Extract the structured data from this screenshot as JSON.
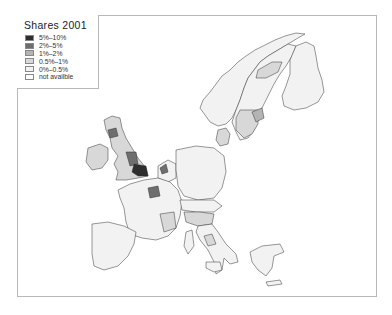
{
  "legend": {
    "title": "Shares 2001",
    "items": [
      {
        "label": "5%–10%",
        "color": "#2e2e2e"
      },
      {
        "label": "2%–5%",
        "color": "#6e6e6e"
      },
      {
        "label": "1%–2%",
        "color": "#b4b4b4"
      },
      {
        "label": "0.5%–1%",
        "color": "#d8d8d8"
      },
      {
        "label": "0%–0.5%",
        "color": "#f2f2f2"
      },
      {
        "label": "not availble",
        "color": "#ffffff"
      }
    ]
  },
  "map": {
    "region": "Europe (NUTS regions)",
    "highlighted_regions": [
      {
        "name": "Ile-de-France area",
        "class": "2%–5%"
      },
      {
        "name": "London / South East England",
        "class": "5%–10%"
      },
      {
        "name": "Noord-Holland / Zuid-Holland",
        "class": "2%–5%"
      },
      {
        "name": "Scotland central belt",
        "class": "2%–5%"
      },
      {
        "name": "Stockholm / Southern Sweden",
        "class": "1%–2%"
      },
      {
        "name": "Northern Italy / Lazio",
        "class": "1%–2%"
      }
    ]
  }
}
